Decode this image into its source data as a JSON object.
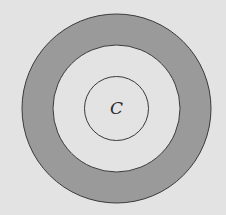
{
  "diagram": {
    "type": "concentric-circles",
    "center": {
      "x": 116.5,
      "y": 108.5
    },
    "circles": [
      {
        "name": "outer-circle",
        "radius": 94.5
      },
      {
        "name": "middle-circle",
        "radius": 63.5
      },
      {
        "name": "inner-circle",
        "radius": 32
      }
    ],
    "shaded_region": "annulus between outer and middle circle",
    "center_label": "C",
    "colors": {
      "background": "#e3e3e3",
      "shaded_ring": "#9a9a9a",
      "unshaded_fill": "#e3e3e3",
      "stroke": "#3a3a3a"
    }
  }
}
